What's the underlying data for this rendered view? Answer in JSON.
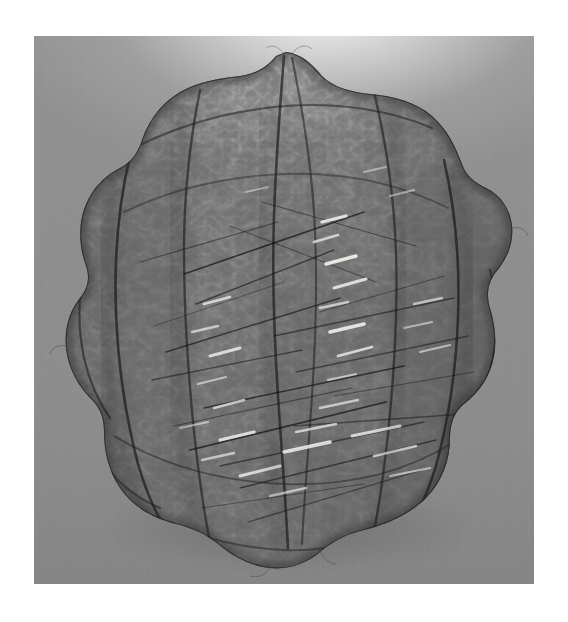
{
  "page": {
    "type": "photograph",
    "border_color": "#ffffff",
    "alt_text": "A large lumpy organic sculpture woven from fine dark wire mesh, photographed against a plain grey studio backdrop with a bright highlight above its crown."
  },
  "photo": {
    "frame": {
      "left": 34,
      "top": 36,
      "width": 500,
      "height": 548
    },
    "backdrop": {
      "base_color": "#8a8a8a",
      "top_color": "#8f8f8f",
      "bottom_color": "#838383",
      "highlight_color": "#ffffff",
      "highlight_position": "top-center",
      "shadow_color": "#000000"
    },
    "object": {
      "name": "wire-mesh-sculpture",
      "silhouette": "lumpy rounded mass with scalloped lobes, wider than tall in the mid-section, tapering to a peak at the top",
      "mesh_color": "#2a2a2a",
      "mesh_fill_color": "#7e7e7e",
      "highlight_color": "#f2f2ee",
      "seam_color": "#1a1a1a",
      "lobe_count": 5,
      "bounds": {
        "left": 0.07,
        "top": 0.04,
        "right": 0.95,
        "bottom": 0.97
      }
    }
  },
  "icons": {
    "sculpture": "wire-mesh-sculpture-icon",
    "backdrop": "studio-backdrop-icon"
  }
}
